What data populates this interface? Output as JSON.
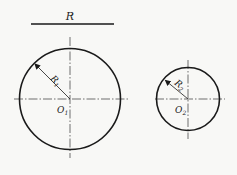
{
  "diagram": {
    "type": "geometry-circles",
    "reference_segment": {
      "label": "R"
    },
    "circles": [
      {
        "id": "circle-1",
        "center_label": "O",
        "center_sub": "1",
        "radius_label": "R",
        "radius_sub": "1"
      },
      {
        "id": "circle-2",
        "center_label": "O",
        "center_sub": "2",
        "radius_label": "R",
        "radius_sub": "2"
      }
    ],
    "colors": {
      "stroke": "#1a1a1a",
      "centerline": "#333333",
      "background": "#f8f8f6"
    }
  }
}
